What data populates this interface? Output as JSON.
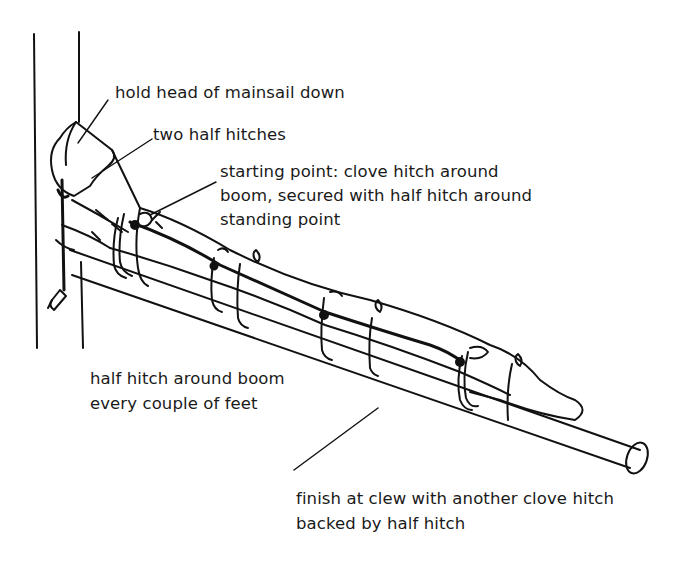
{
  "diagram": {
    "ink_color": "#111111",
    "background": "#ffffff"
  },
  "labels": {
    "hold_head": {
      "lines": [
        "hold head of mainsail down"
      ]
    },
    "two_half_hitches": {
      "lines": [
        "two half hitches"
      ]
    },
    "starting_point": {
      "lines": [
        "starting point: clove hitch around",
        "boom, secured with half hitch around",
        "standing point"
      ]
    },
    "half_hitch_every": {
      "lines": [
        "half hitch around boom",
        "every couple of feet"
      ]
    },
    "finish_at_clew": {
      "lines": [
        "finish at clew with another clove hitch",
        "backed by half hitch"
      ]
    }
  }
}
